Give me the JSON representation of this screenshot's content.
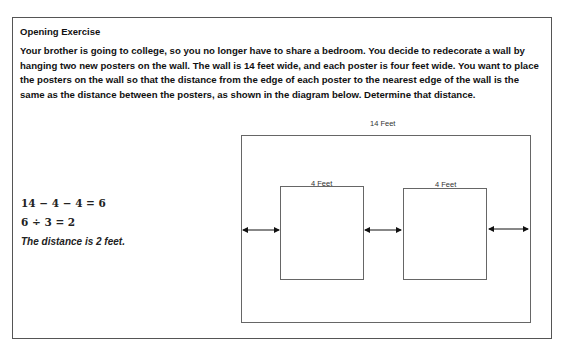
{
  "exercise": {
    "title": "Opening Exercise",
    "prompt": "Your brother is going to college, so you no longer have to share a bedroom.  You decide to redecorate a wall by hanging two new posters on the wall.  The wall is 14 feet wide, and each poster is four feet wide.  You want to place the posters on the wall so that the distance from the edge of each poster to the nearest edge of the wall is the same as the distance between the posters, as shown in the diagram below.  Determine that distance."
  },
  "solution": {
    "equation_1": "14 − 4 − 4 = 6",
    "equation_2": "6 ÷ 3 = 2",
    "answer": "The distance is 2 feet."
  },
  "diagram": {
    "wall_label": "14 Feet",
    "poster_1_label": "4 Feet",
    "poster_2_label": "4 Feet"
  }
}
